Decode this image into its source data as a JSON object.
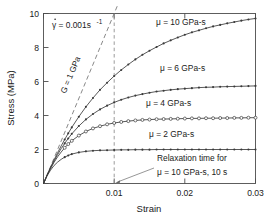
{
  "chart_data": {
    "type": "line",
    "title": "",
    "xlabel": "Strain",
    "ylabel": "Stress (MPa)",
    "xlim": [
      0,
      0.03
    ],
    "ylim": [
      0,
      10
    ],
    "xticks": [
      "0",
      "0.01",
      "0.02",
      "0.03"
    ],
    "xtick_values": [
      0,
      0.01,
      0.02,
      0.03
    ],
    "yticks": [
      "0",
      "2",
      "4",
      "6",
      "8",
      "10"
    ],
    "ytick_values": [
      0,
      2,
      4,
      6,
      8,
      10
    ],
    "grid": false,
    "legend_position": "inline-labels",
    "series": [
      {
        "name": "μ = 10 GPa·s",
        "marker": "filled-circle",
        "x": [
          0,
          0.0005,
          0.001,
          0.0015,
          0.002,
          0.0025,
          0.003,
          0.0035,
          0.004,
          0.005,
          0.006,
          0.007,
          0.008,
          0.009,
          0.01,
          0.011,
          0.012,
          0.013,
          0.014,
          0.015,
          0.016,
          0.017,
          0.018,
          0.019,
          0.02,
          0.021,
          0.022,
          0.023,
          0.024,
          0.025,
          0.026,
          0.027,
          0.028,
          0.029,
          0.03
        ],
        "y": [
          0,
          0.49,
          0.95,
          1.39,
          1.81,
          2.21,
          2.59,
          2.95,
          3.3,
          3.93,
          4.51,
          5.03,
          5.51,
          5.93,
          6.32,
          6.68,
          7.0,
          7.3,
          7.57,
          7.81,
          8.03,
          8.24,
          8.42,
          8.59,
          8.75,
          8.89,
          9.01,
          9.13,
          9.24,
          9.33,
          9.42,
          9.5,
          9.58,
          9.65,
          9.71
        ]
      },
      {
        "name": "μ = 6 GPa·s",
        "marker": "filled-circle",
        "x": [
          0,
          0.0005,
          0.001,
          0.0015,
          0.002,
          0.0025,
          0.003,
          0.0035,
          0.004,
          0.005,
          0.006,
          0.007,
          0.008,
          0.009,
          0.01,
          0.011,
          0.012,
          0.013,
          0.014,
          0.015,
          0.016,
          0.017,
          0.018,
          0.019,
          0.02,
          0.021,
          0.022,
          0.023,
          0.024,
          0.025,
          0.026,
          0.027,
          0.028,
          0.029,
          0.03
        ],
        "y": [
          0,
          0.48,
          0.92,
          1.33,
          1.7,
          2.05,
          2.36,
          2.65,
          2.92,
          3.38,
          3.77,
          4.09,
          4.36,
          4.58,
          4.77,
          4.93,
          5.06,
          5.17,
          5.26,
          5.34,
          5.41,
          5.46,
          5.51,
          5.55,
          5.58,
          5.61,
          5.64,
          5.66,
          5.67,
          5.69,
          5.7,
          5.71,
          5.72,
          5.73,
          5.74
        ]
      },
      {
        "name": "μ = 4 GPa·s",
        "marker": "open-circle",
        "x": [
          0,
          0.0005,
          0.001,
          0.0015,
          0.002,
          0.0025,
          0.003,
          0.0035,
          0.004,
          0.005,
          0.006,
          0.007,
          0.008,
          0.009,
          0.01,
          0.011,
          0.012,
          0.013,
          0.014,
          0.015,
          0.016,
          0.017,
          0.018,
          0.019,
          0.02,
          0.021,
          0.022,
          0.023,
          0.024,
          0.025,
          0.026,
          0.027,
          0.028,
          0.029,
          0.03
        ],
        "y": [
          0,
          0.47,
          0.88,
          1.25,
          1.57,
          1.85,
          2.1,
          2.32,
          2.51,
          2.82,
          3.06,
          3.24,
          3.37,
          3.48,
          3.56,
          3.62,
          3.67,
          3.71,
          3.74,
          3.76,
          3.78,
          3.79,
          3.8,
          3.81,
          3.82,
          3.83,
          3.83,
          3.84,
          3.84,
          3.85,
          3.85,
          3.86,
          3.86,
          3.87,
          3.87
        ]
      },
      {
        "name": "μ = 2 GPa·s",
        "marker": "filled-circle",
        "x": [
          0,
          0.0005,
          0.001,
          0.0015,
          0.002,
          0.0025,
          0.003,
          0.0035,
          0.004,
          0.005,
          0.006,
          0.007,
          0.008,
          0.009,
          0.01,
          0.011,
          0.012,
          0.013,
          0.014,
          0.015,
          0.016,
          0.017,
          0.018,
          0.019,
          0.02,
          0.021,
          0.022,
          0.023,
          0.024,
          0.025,
          0.026,
          0.027,
          0.028,
          0.029,
          0.03
        ],
        "y": [
          0,
          0.44,
          0.79,
          1.06,
          1.26,
          1.42,
          1.55,
          1.65,
          1.73,
          1.83,
          1.89,
          1.93,
          1.95,
          1.96,
          1.97,
          1.98,
          1.98,
          1.99,
          1.99,
          1.99,
          2.0,
          2.0,
          2.0,
          2.0,
          2.0,
          2.0,
          2.0,
          2.0,
          2.0,
          2.0,
          2.0,
          2.0,
          2.0,
          2.0,
          2.0
        ]
      }
    ],
    "reference_line": {
      "name": "G = 1 GPa",
      "style": "dashed",
      "x": [
        0,
        0.0105
      ],
      "y": [
        0,
        10.5
      ]
    },
    "vertical_line": {
      "name": "relaxation-time-marker",
      "style": "dashed",
      "x": 0.01
    },
    "annotations": [
      {
        "name": "strain-rate",
        "text": "γ̇ = 0.001s⁻¹"
      },
      {
        "name": "shear-modulus",
        "text": "G = 1 GPa"
      },
      {
        "name": "relaxation-line-1",
        "text": "Relaxation time for"
      },
      {
        "name": "relaxation-line-2",
        "text": "μ = 10 GPa·s, 10 s"
      }
    ]
  },
  "labels": {
    "xaxis": "Strain",
    "yaxis": "Stress (MPa)",
    "xticks": [
      "0",
      "0.01",
      "0.02",
      "0.03"
    ],
    "yticks": [
      "10",
      "8",
      "6",
      "4",
      "2",
      "0"
    ],
    "mu10": "μ = 10 GPa-s",
    "mu6": "μ = 6 GPa-s",
    "mu4": "μ = 4 GPa-s",
    "mu2": "μ = 2 GPa-s",
    "strain_rate": "= 0.001s",
    "strain_rate_symbol": "γ",
    "strain_rate_exp": "-1",
    "modulus": "G = 1 GPa",
    "relax1": "Relaxation time for",
    "relax2": "μ = 10 GPa-s, 10 s"
  },
  "colors": {
    "curve": "#3a3a3a",
    "axis": "#4d4d4d",
    "dash": "#7a7a7a",
    "text": "#1a1a1a",
    "background": "#ffffff"
  }
}
